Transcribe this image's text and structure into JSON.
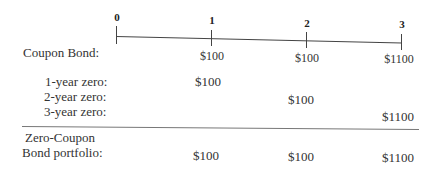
{
  "timeline": {
    "ticks": [
      "0",
      "1",
      "2",
      "3"
    ]
  },
  "coupon_bond": {
    "label": "Coupon Bond:",
    "cashflows": [
      "$100",
      "$100",
      "$1100"
    ]
  },
  "zeros": [
    {
      "label": "1-year zero:",
      "value": "$100",
      "period": 1
    },
    {
      "label": "2-year zero:",
      "value": "$100",
      "period": 2
    },
    {
      "label": "3-year zero:",
      "value": "$1100",
      "period": 3
    }
  ],
  "portfolio": {
    "label_line1": "Zero-Coupon",
    "label_line2": "Bond portfolio:",
    "cashflows": [
      "$100",
      "$100",
      "$1100"
    ]
  }
}
